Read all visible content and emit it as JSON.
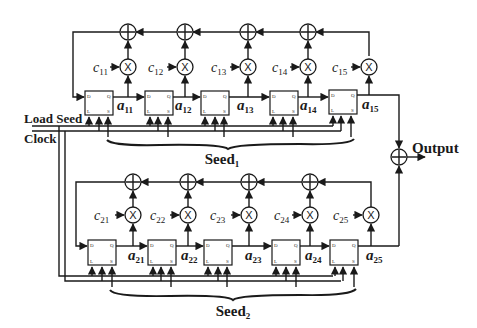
{
  "diagram": {
    "control_signals": {
      "load_seed": "Load Seed",
      "clock": "Clock"
    },
    "output_label": "Output",
    "lfsr1": {
      "seed_label": "Seed",
      "seed_sub": "1",
      "registers": [
        {
          "name": "a",
          "sub": "11"
        },
        {
          "name": "a",
          "sub": "12"
        },
        {
          "name": "a",
          "sub": "13"
        },
        {
          "name": "a",
          "sub": "14"
        },
        {
          "name": "a",
          "sub": "15"
        }
      ],
      "coefficients": [
        {
          "name": "c",
          "sub": "11"
        },
        {
          "name": "c",
          "sub": "12"
        },
        {
          "name": "c",
          "sub": "13"
        },
        {
          "name": "c",
          "sub": "14"
        },
        {
          "name": "c",
          "sub": "15"
        }
      ]
    },
    "lfsr2": {
      "seed_label": "Seed",
      "seed_sub": "2",
      "registers": [
        {
          "name": "a",
          "sub": "21"
        },
        {
          "name": "a",
          "sub": "22"
        },
        {
          "name": "a",
          "sub": "23"
        },
        {
          "name": "a",
          "sub": "24"
        },
        {
          "name": "a",
          "sub": "25"
        }
      ],
      "coefficients": [
        {
          "name": "c",
          "sub": "21"
        },
        {
          "name": "c",
          "sub": "22"
        },
        {
          "name": "c",
          "sub": "23"
        },
        {
          "name": "c",
          "sub": "24"
        },
        {
          "name": "c",
          "sub": "25"
        }
      ]
    },
    "flipflop_pins": {
      "d": "D",
      "q": "Q",
      "l": "L",
      "s": "S"
    },
    "operators": {
      "add": "+",
      "mul": "×"
    }
  }
}
